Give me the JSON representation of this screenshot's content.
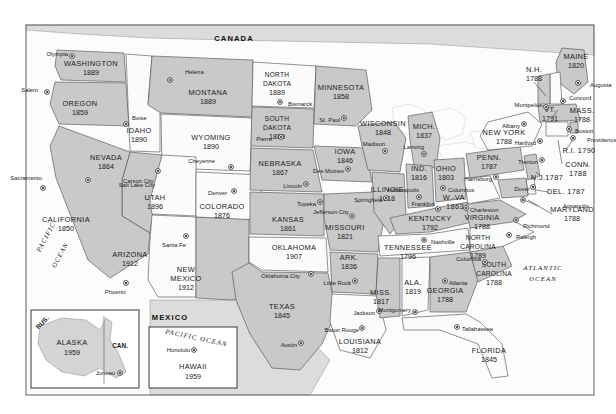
{
  "page": {
    "background_color": "#ffffff",
    "frame_color": "#6d6d6d"
  },
  "legend_colors": {
    "state_fill_dark": "#c9c9c9",
    "state_fill_light": "#fbfbfb",
    "border": "#4a4a4a",
    "water": "#fefefe",
    "neighbor": "#dcdcdc"
  },
  "countries": [
    {
      "name": "CANADA",
      "x": 234,
      "y": 41
    },
    {
      "name": "MEXICO",
      "x": 170,
      "y": 320
    }
  ],
  "oceans": [
    {
      "name": "PACIFIC",
      "x": 48,
      "y": 238,
      "rotate": -62
    },
    {
      "name": "OCEAN",
      "x": 56,
      "y": 258,
      "rotate": -62
    },
    {
      "name": "ATLANTIC",
      "x": 543,
      "y": 270,
      "rotate": 0
    },
    {
      "name": "OCEAN",
      "x": 543,
      "y": 281,
      "rotate": 0
    }
  ],
  "states": [
    {
      "abbr": "WA",
      "name": "WASHINGTON",
      "year": "1889",
      "capital": "Olympia",
      "lx": 91,
      "ly": 66,
      "yx": 91,
      "yy": 75,
      "cx": 68,
      "cy": 54,
      "dx": 72,
      "dy": 56,
      "shade": "dark"
    },
    {
      "abbr": "OR",
      "name": "OREGON",
      "year": "1859",
      "capital": "Salem",
      "lx": 80,
      "ly": 106,
      "yx": 80,
      "yy": 115,
      "cx": 38,
      "cy": 90,
      "dx": 47,
      "dy": 92,
      "shade": "dark"
    },
    {
      "abbr": "ID",
      "name": "IDAHO",
      "year": "1890",
      "capital": "Boise",
      "lx": 139,
      "ly": 133,
      "yx": 139,
      "yy": 142,
      "cx": 132,
      "cy": 118,
      "dx": 126,
      "dy": 124,
      "shade": "light"
    },
    {
      "abbr": "MT",
      "name": "MONTANA",
      "year": "1889",
      "capital": "Helena",
      "lx": 208,
      "ly": 95,
      "yx": 208,
      "yy": 104,
      "cx": 185,
      "cy": 72,
      "dx": 170,
      "dy": 80,
      "shade": "dark"
    },
    {
      "abbr": "WY",
      "name": "WYOMING",
      "year": "1890",
      "capital": "Cheyenne",
      "lx": 211,
      "ly": 140,
      "yx": 211,
      "yy": 149,
      "cx": 215,
      "cy": 161,
      "dx": 231,
      "dy": 167,
      "shade": "light"
    },
    {
      "abbr": "NV",
      "name": "NEVADA",
      "year": "1864",
      "capital": "Carson City",
      "lx": 106,
      "ly": 160,
      "yx": 106,
      "yy": 169,
      "cx": 123,
      "cy": 181,
      "dx": 88,
      "dy": 180,
      "shade": "dark"
    },
    {
      "abbr": "UT",
      "name": "UTAH",
      "year": "1896",
      "capital": "Salt Lake City",
      "lx": 155,
      "ly": 200,
      "yx": 155,
      "yy": 209,
      "cx": 155,
      "cy": 185,
      "dx": 158,
      "dy": 171,
      "shade": "light"
    },
    {
      "abbr": "CA",
      "name": "CALIFORNIA",
      "year": "1850",
      "capital": "Sacramento",
      "lx": 66,
      "ly": 222,
      "yx": 66,
      "yy": 231,
      "cx": 42,
      "cy": 178,
      "dx": 43,
      "dy": 188,
      "shade": "dark"
    },
    {
      "abbr": "AZ",
      "name": "ARIZONA",
      "year": "1912",
      "capital": "Phoenix",
      "lx": 130,
      "ly": 257,
      "yx": 130,
      "yy": 266,
      "cx": 126,
      "cy": 292,
      "dx": 126,
      "dy": 283,
      "shade": "light"
    },
    {
      "abbr": "NM",
      "name": "NEW MEXICO",
      "year": "1912",
      "capital": "Santa Fe",
      "lx": 186,
      "ly": 272,
      "yx": 186,
      "yy": 290,
      "cx": 186,
      "cy": 245,
      "dx": 186,
      "dy": 236,
      "shade": "dark"
    },
    {
      "abbr": "CO",
      "name": "COLORADO",
      "year": "1876",
      "capital": "Denver",
      "lx": 222,
      "ly": 209,
      "yx": 222,
      "yy": 218,
      "cx": 227,
      "cy": 193,
      "dx": 234,
      "dy": 191,
      "shade": "light"
    },
    {
      "abbr": "ND",
      "name": "NORTH DAKOTA",
      "year": "1889",
      "capital": "Bismarck",
      "lx": 277,
      "ly": 77,
      "yx": 277,
      "yy": 95,
      "cx": 288,
      "cy": 104,
      "dx": 280,
      "dy": 102,
      "shade": "light"
    },
    {
      "abbr": "SD",
      "name": "SOUTH DAKOTA",
      "year": "1889",
      "capital": "Pierre",
      "lx": 277,
      "ly": 121,
      "yx": 277,
      "yy": 130,
      "cx": 272,
      "cy": 139,
      "dx": 281,
      "dy": 137,
      "shade": "dark"
    },
    {
      "abbr": "NE",
      "name": "NEBRASKA",
      "year": "1867",
      "capital": "Lincoln",
      "lx": 280,
      "ly": 166,
      "yx": 280,
      "yy": 175,
      "cx": 302,
      "cy": 186,
      "dx": 306,
      "dy": 184,
      "shade": "dark"
    },
    {
      "abbr": "KS",
      "name": "KANSAS",
      "year": "1861",
      "capital": "Topeka",
      "lx": 288,
      "ly": 222,
      "yx": 288,
      "yy": 231,
      "cx": 316,
      "cy": 204,
      "dx": 320,
      "dy": 202,
      "shade": "dark"
    },
    {
      "abbr": "OK",
      "name": "OKLAHOMA",
      "year": "1907",
      "capital": "Oklahoma City",
      "lx": 294,
      "ly": 250,
      "yx": 294,
      "yy": 259,
      "cx": 300,
      "cy": 276,
      "dx": 311,
      "dy": 274,
      "shade": "light"
    },
    {
      "abbr": "TX",
      "name": "TEXAS",
      "year": "1845",
      "capital": "Austin",
      "lx": 282,
      "ly": 309,
      "yx": 282,
      "yy": 318,
      "cx": 297,
      "cy": 345,
      "dx": 301,
      "dy": 343,
      "shade": "dark"
    },
    {
      "abbr": "MN",
      "name": "MINNESOTA",
      "year": "1858",
      "capital": "St. Paul",
      "lx": 341,
      "ly": 90,
      "yx": 341,
      "yy": 99,
      "cx": 340,
      "cy": 120,
      "dx": 344,
      "dy": 118,
      "shade": "dark"
    },
    {
      "abbr": "IA",
      "name": "IOWA",
      "year": "1846",
      "capital": "Des Moines",
      "lx": 345,
      "ly": 154,
      "yx": 345,
      "yy": 163,
      "cx": 344,
      "cy": 171,
      "dx": 348,
      "dy": 169,
      "shade": "dark"
    },
    {
      "abbr": "MO",
      "name": "MISSOURI",
      "year": "1821",
      "capital": "Jefferson City",
      "lx": 345,
      "ly": 230,
      "yx": 345,
      "yy": 239,
      "cx": 349,
      "cy": 212,
      "dx": 352,
      "dy": 216,
      "shade": "dark"
    },
    {
      "abbr": "AR",
      "name": "ARK.",
      "year": "1836",
      "capital": "Little Rock",
      "lx": 349,
      "ly": 260,
      "yx": 349,
      "yy": 269,
      "cx": 351,
      "cy": 283,
      "dx": 355,
      "dy": 281,
      "shade": "dark"
    },
    {
      "abbr": "LA",
      "name": "LOUISIANA",
      "year": "1812",
      "capital": "Baton Rouge",
      "lx": 360,
      "ly": 344,
      "yx": 360,
      "yy": 353,
      "cx": 359,
      "cy": 330,
      "dx": 362,
      "dy": 328,
      "shade": "light"
    },
    {
      "abbr": "WI",
      "name": "WISCONSIN",
      "year": "1848",
      "capital": "Madison",
      "lx": 383,
      "ly": 126,
      "yx": 383,
      "yy": 135,
      "cx": 385,
      "cy": 144,
      "dx": 385,
      "dy": 151,
      "shade": "dark"
    },
    {
      "abbr": "IL",
      "name": "ILLINOIS",
      "year": "1818",
      "capital": "Springfield",
      "lx": 387,
      "ly": 192,
      "yx": 387,
      "yy": 201,
      "cx": 382,
      "cy": 200,
      "dx": 386,
      "dy": 198,
      "shade": "dark"
    },
    {
      "abbr": "MI",
      "name": "MICH.",
      "year": "1837",
      "capital": "Lansing",
      "lx": 424,
      "ly": 129,
      "yx": 424,
      "yy": 138,
      "cx": 424,
      "cy": 147,
      "dx": 424,
      "dy": 154,
      "shade": "dark"
    },
    {
      "abbr": "IN",
      "name": "IND.",
      "year": "1816",
      "capital": "Indianapolis",
      "lx": 419,
      "ly": 171,
      "yx": 419,
      "yy": 180,
      "cx": 419,
      "cy": 190,
      "dx": 419,
      "dy": 197,
      "shade": "dark"
    },
    {
      "abbr": "OH",
      "name": "OHIO",
      "year": "1803",
      "capital": "Columbus",
      "lx": 446,
      "ly": 171,
      "yx": 446,
      "yy": 180,
      "cx": 448,
      "cy": 190,
      "dx": 443,
      "dy": 188,
      "shade": "dark"
    },
    {
      "abbr": "KY",
      "name": "KENTUCKY",
      "year": "1792",
      "capital": "Frankfort",
      "lx": 430,
      "ly": 221,
      "yx": 430,
      "yy": 230,
      "cx": 435,
      "cy": 204,
      "dx": 438,
      "dy": 209,
      "shade": "dark"
    },
    {
      "abbr": "TN",
      "name": "TENNESSEE",
      "year": "1796",
      "capital": "Nashville",
      "lx": 408,
      "ly": 250,
      "yx": 408,
      "yy": 259,
      "cx": 431,
      "cy": 242,
      "dx": 424,
      "dy": 240,
      "shade": "light"
    },
    {
      "abbr": "MS",
      "name": "MISS.",
      "year": "1817",
      "capital": "Jackson",
      "lx": 381,
      "ly": 295,
      "yx": 381,
      "yy": 304,
      "cx": 375,
      "cy": 313,
      "dx": 379,
      "dy": 311,
      "shade": "dark"
    },
    {
      "abbr": "AL",
      "name": "ALA.",
      "year": "1819",
      "capital": "Montgomery",
      "lx": 413,
      "ly": 285,
      "yx": 413,
      "yy": 294,
      "cx": 411,
      "cy": 310,
      "dx": 415,
      "dy": 312,
      "shade": "light"
    },
    {
      "abbr": "GA",
      "name": "GEORGIA",
      "year": "1788",
      "capital": "Atlanta",
      "lx": 445,
      "ly": 293,
      "yx": 445,
      "yy": 302,
      "cx": 449,
      "cy": 283,
      "dx": 445,
      "dy": 281,
      "shade": "dark"
    },
    {
      "abbr": "FL",
      "name": "FLORIDA",
      "year": "1845",
      "capital": "Tallahassee",
      "lx": 489,
      "ly": 353,
      "yx": 489,
      "yy": 362,
      "cx": 462,
      "cy": 329,
      "dx": 457,
      "dy": 327,
      "shade": "light"
    },
    {
      "abbr": "SC",
      "name": "SOUTH CAROLINA",
      "year": "1788",
      "capital": "Columbia",
      "lx": 494,
      "ly": 267,
      "yx": 494,
      "yy": 285,
      "cx": 481,
      "cy": 259,
      "dx": 485,
      "dy": 262,
      "shade": "dark"
    },
    {
      "abbr": "NC",
      "name": "NORTH CAROLINA",
      "year": "1789",
      "capital": "Raleigh",
      "lx": 478,
      "ly": 240,
      "yx": 478,
      "yy": 258,
      "cx": 516,
      "cy": 237,
      "dx": 509,
      "dy": 235,
      "shade": "light"
    },
    {
      "abbr": "VA",
      "name": "VIRGINIA",
      "year": "1788",
      "capital": "Richmond",
      "lx": 482,
      "ly": 220,
      "yx": 482,
      "yy": 229,
      "cx": 523,
      "cy": 226,
      "dx": 516,
      "dy": 220,
      "shade": "dark"
    },
    {
      "abbr": "WV",
      "name": "W.-VA. 1863",
      "year": "",
      "capital": "Charleston",
      "lx": 455,
      "ly": 200,
      "yx": 455,
      "yy": 200,
      "cx": 470,
      "cy": 210,
      "dx": 466,
      "dy": 208,
      "shade": "light"
    },
    {
      "abbr": "PA",
      "name": "PENN.",
      "year": "1787",
      "capital": "Harrisburg",
      "lx": 489,
      "ly": 160,
      "yx": 489,
      "yy": 169,
      "cx": 492,
      "cy": 179,
      "dx": 496,
      "dy": 177,
      "shade": "dark"
    },
    {
      "abbr": "NY",
      "name": "NEW YORK",
      "year": "1788",
      "capital": "Albany",
      "lx": 504,
      "ly": 135,
      "yx": 504,
      "yy": 144,
      "cx": 520,
      "cy": 126,
      "dx": 524,
      "dy": 124,
      "shade": "light"
    },
    {
      "abbr": "ME",
      "name": "MAINE",
      "year": "1820",
      "capital": "Augusta",
      "lx": 576,
      "ly": 59,
      "yx": 576,
      "yy": 68,
      "cx": 590,
      "cy": 85,
      "dx": 578,
      "dy": 83,
      "shade": "dark"
    },
    {
      "abbr": "NH",
      "name": "N.H.",
      "year": "1788",
      "capital": "Concord",
      "lx": 534,
      "ly": 72,
      "yx": 534,
      "yy": 81,
      "cx": 569,
      "cy": 98,
      "dx": 563,
      "dy": 101,
      "shade": "light"
    },
    {
      "abbr": "VT",
      "name": "VT.",
      "year": "1791",
      "capital": "Montpelier",
      "lx": 550,
      "ly": 112,
      "yx": 550,
      "yy": 121,
      "cx": 542,
      "cy": 105,
      "dx": 546,
      "dy": 107,
      "shade": "dark"
    },
    {
      "abbr": "MA",
      "name": "MASS.",
      "year": "1788",
      "capital": "Boston",
      "lx": 582,
      "ly": 113,
      "yx": 582,
      "yy": 122,
      "cx": 575,
      "cy": 131,
      "dx": 569,
      "dy": 129,
      "shade": "dark"
    },
    {
      "abbr": "RI",
      "name": "R.I. 1790",
      "year": "",
      "capital": "Providence",
      "lx": 579,
      "ly": 153,
      "yx": 579,
      "yy": 153,
      "cx": 587,
      "cy": 140,
      "dx": 573,
      "dy": 138,
      "shade": "dark"
    },
    {
      "abbr": "CT",
      "name": "CONN. 1788",
      "year": "",
      "capital": "Hartford",
      "lx": 578,
      "ly": 167,
      "yx": 578,
      "yy": 167,
      "cx": 536,
      "cy": 143,
      "dx": 540,
      "dy": 141,
      "shade": "light"
    },
    {
      "abbr": "NJ",
      "name": "N.J.1787",
      "year": "",
      "capital": "Trenton",
      "lx": 547,
      "ly": 180,
      "yx": 547,
      "yy": 180,
      "cx": 538,
      "cy": 162,
      "dx": 542,
      "dy": 160,
      "shade": "dark"
    },
    {
      "abbr": "DE",
      "name": "DEL. 1787",
      "year": "",
      "capital": "Dover",
      "lx": 566,
      "ly": 194,
      "yx": 566,
      "yy": 194,
      "cx": 530,
      "cy": 189,
      "dx": 533,
      "dy": 187,
      "shade": "light"
    },
    {
      "abbr": "MD",
      "name": "MARYLAND",
      "year": "1788",
      "capital": "Annapolis",
      "lx": 572,
      "ly": 212,
      "yx": 572,
      "yy": 221,
      "cx": 563,
      "cy": 206,
      "dx": 523,
      "dy": 200,
      "shade": "dark"
    }
  ],
  "insets": [
    {
      "id": "alaska",
      "name": "ALASKA",
      "year": "1959",
      "capital": "Juneau",
      "box": {
        "x": 31,
        "y": 310,
        "w": 108,
        "h": 78
      },
      "label_x": 72,
      "label_y": 345,
      "year_y": 355,
      "capital_x": 118,
      "capital_y": 373,
      "neighbors": [
        {
          "name": "RUS.",
          "x": 44,
          "y": 322,
          "rotate": -45
        },
        {
          "name": "CAN.",
          "x": 118,
          "y": 348,
          "rotate": 0
        }
      ]
    },
    {
      "id": "hawaii",
      "name": "HAWAII",
      "year": "1959",
      "capital": "Honolulu",
      "box": {
        "x": 149,
        "y": 327,
        "w": 88,
        "h": 61
      },
      "label_x": 193,
      "label_y": 367,
      "year_y": 377,
      "capital_x": 190,
      "capital_y": 350,
      "ocean_label": "PACIFIC OCEAN",
      "ocean_x": 196,
      "ocean_y": 338
    }
  ],
  "frame": {
    "x": 26,
    "y": 25,
    "w": 568,
    "h": 370
  }
}
